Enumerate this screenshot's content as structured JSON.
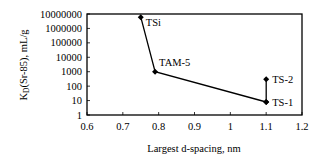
{
  "chart_data": {
    "type": "line",
    "title": "",
    "xlabel": "Largest d-spacing, nm",
    "ylabel": "K_D(Sr-85), mL/g",
    "ylabel_main": "K",
    "ylabel_sub": "D",
    "ylabel_rest": "(Sr-85), mL/g",
    "xlim": [
      0.6,
      1.2
    ],
    "ylim": [
      1,
      10000000
    ],
    "yscale": "log",
    "grid": false,
    "legend": "none",
    "x_ticks": [
      "0.6",
      "0.7",
      "0.8",
      "0.9",
      "1",
      "1.1",
      "1.2"
    ],
    "y_ticks": [
      "1",
      "10",
      "100",
      "1000",
      "10000",
      "100000",
      "1000000",
      "10000000"
    ],
    "series": [
      {
        "name": "main",
        "points": [
          {
            "label": "TSi",
            "x": 0.75,
            "y": 6000000
          },
          {
            "label": "TAM-5",
            "x": 0.79,
            "y": 1000
          },
          {
            "label": "TS-1",
            "x": 1.1,
            "y": 8
          }
        ]
      },
      {
        "name": "TS-1 to TS-2",
        "points": [
          {
            "label": "TS-1",
            "x": 1.1,
            "y": 8
          },
          {
            "label": "TS-2",
            "x": 1.1,
            "y": 300
          }
        ]
      }
    ]
  }
}
